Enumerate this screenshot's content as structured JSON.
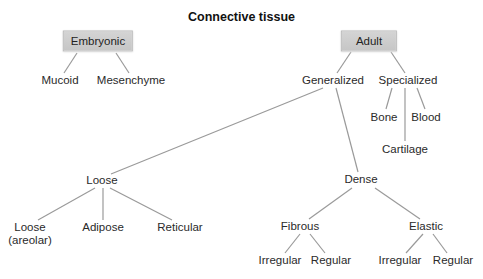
{
  "title": "Connective tissue",
  "nodes": {
    "embryonic": "Embryonic",
    "mucoid": "Mucoid",
    "mesenchyme": "Mesenchyme",
    "adult": "Adult",
    "generalized": "Generalized",
    "specialized": "Specialized",
    "bone": "Bone",
    "blood": "Blood",
    "cartilage": "Cartilage",
    "loose": "Loose",
    "dense": "Dense",
    "loose_areolar_line1": "Loose",
    "loose_areolar_line2": "(areolar)",
    "adipose": "Adipose",
    "reticular": "Reticular",
    "fibrous": "Fibrous",
    "elastic": "Elastic",
    "fibrous_irregular": "Irregular",
    "fibrous_regular": "Regular",
    "elastic_irregular": "Irregular",
    "elastic_regular": "Regular"
  },
  "colors": {
    "box_fill": "#cccccc",
    "edge": "#9a9a9a",
    "text": "#222222"
  },
  "tree": {
    "label": "Connective tissue",
    "children": [
      {
        "label": "Embryonic",
        "children": [
          {
            "label": "Mucoid"
          },
          {
            "label": "Mesenchyme"
          }
        ]
      },
      {
        "label": "Adult",
        "children": [
          {
            "label": "Generalized",
            "children": [
              {
                "label": "Loose",
                "children": [
                  {
                    "label": "Loose (areolar)"
                  },
                  {
                    "label": "Adipose"
                  },
                  {
                    "label": "Reticular"
                  }
                ]
              },
              {
                "label": "Dense",
                "children": [
                  {
                    "label": "Fibrous",
                    "children": [
                      {
                        "label": "Irregular"
                      },
                      {
                        "label": "Regular"
                      }
                    ]
                  },
                  {
                    "label": "Elastic",
                    "children": [
                      {
                        "label": "Irregular"
                      },
                      {
                        "label": "Regular"
                      }
                    ]
                  }
                ]
              }
            ]
          },
          {
            "label": "Specialized",
            "children": [
              {
                "label": "Bone"
              },
              {
                "label": "Cartilage"
              },
              {
                "label": "Blood"
              }
            ]
          }
        ]
      }
    ]
  }
}
